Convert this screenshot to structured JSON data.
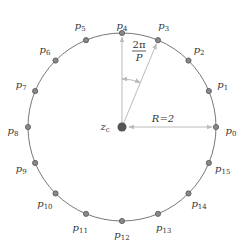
{
  "diagram": {
    "center": {
      "label": "z",
      "sub": "c",
      "x": 122,
      "y": 127
    },
    "radius_px": 94,
    "radius_label": "R=2",
    "angle_label": {
      "num": "2π",
      "den": "P"
    },
    "num_points": 16,
    "point_prefix": "p",
    "points": [
      {
        "name": "p",
        "sub": "0"
      },
      {
        "name": "p",
        "sub": "1"
      },
      {
        "name": "p",
        "sub": "2"
      },
      {
        "name": "p",
        "sub": "3"
      },
      {
        "name": "p",
        "sub": "4"
      },
      {
        "name": "p",
        "sub": "5"
      },
      {
        "name": "p",
        "sub": "6"
      },
      {
        "name": "p",
        "sub": "7"
      },
      {
        "name": "p",
        "sub": "8"
      },
      {
        "name": "p",
        "sub": "9"
      },
      {
        "name": "p",
        "sub": "10"
      },
      {
        "name": "p",
        "sub": "11"
      },
      {
        "name": "p",
        "sub": "12"
      },
      {
        "name": "p",
        "sub": "13"
      },
      {
        "name": "p",
        "sub": "14"
      },
      {
        "name": "p",
        "sub": "15"
      }
    ],
    "colors": {
      "circle": "#777777",
      "point_fill": "#888888",
      "point_stroke": "#555555",
      "center_fill": "#555555",
      "arrow": "#bbbbbb",
      "text": "#333333"
    }
  }
}
